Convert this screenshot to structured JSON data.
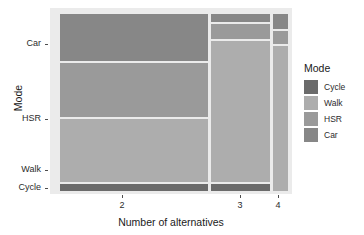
{
  "chart_data": {
    "type": "bar",
    "subtype": "mosaic",
    "title": "",
    "xlabel": "Number of alternatives",
    "ylabel": "Mode",
    "xtick_labels": [
      "2",
      "3",
      "4"
    ],
    "ytick_labels": [
      "Car",
      "HSR",
      "Walk",
      "Cycle"
    ],
    "grid": false,
    "legend": {
      "title": "Mode",
      "position": "right",
      "entries": [
        {
          "label": "Cycle",
          "color": "#6b6b6b"
        },
        {
          "label": "Walk",
          "color": "#adadad"
        },
        {
          "label": "HSR",
          "color": "#9a9a9a"
        },
        {
          "label": "Car",
          "color": "#878787"
        }
      ]
    },
    "categories": [
      "2",
      "3",
      "4"
    ],
    "column_widths": [
      0.612,
      0.244,
      0.062
    ],
    "series": [
      {
        "name": "Car",
        "color": "#878787",
        "values": [
          0.262,
          0.046,
          0.081
        ]
      },
      {
        "name": "HSR",
        "color": "#9a9a9a",
        "values": [
          0.301,
          0.081,
          0.07
        ]
      },
      {
        "name": "Walk",
        "color": "#adadad",
        "values": [
          0.339,
          0.758,
          0.849
        ]
      },
      {
        "name": "Cycle",
        "color": "#6b6b6b",
        "values": [
          0.032,
          0.032,
          0.0
        ]
      }
    ],
    "tiles": [
      {
        "col": "2",
        "mode": "Car",
        "x": 60,
        "y": 14,
        "w": 148,
        "h": 47,
        "color": "#878787"
      },
      {
        "col": "2",
        "mode": "HSR",
        "x": 60,
        "y": 63,
        "w": 148,
        "h": 54,
        "color": "#9a9a9a"
      },
      {
        "col": "2",
        "mode": "Walk",
        "x": 60,
        "y": 119,
        "w": 148,
        "h": 63,
        "color": "#adadad"
      },
      {
        "col": "2",
        "mode": "Cycle",
        "x": 60,
        "y": 184,
        "w": 148,
        "h": 7,
        "color": "#6b6b6b"
      },
      {
        "col": "3",
        "mode": "Car",
        "x": 211,
        "y": 14,
        "w": 59,
        "h": 8,
        "color": "#878787"
      },
      {
        "col": "3",
        "mode": "HSR",
        "x": 211,
        "y": 24,
        "w": 59,
        "h": 15,
        "color": "#9a9a9a"
      },
      {
        "col": "3",
        "mode": "Walk",
        "x": 211,
        "y": 41,
        "w": 59,
        "h": 141,
        "color": "#adadad"
      },
      {
        "col": "3",
        "mode": "Cycle",
        "x": 211,
        "y": 184,
        "w": 59,
        "h": 7,
        "color": "#6b6b6b"
      },
      {
        "col": "4",
        "mode": "Car",
        "x": 273,
        "y": 14,
        "w": 15,
        "h": 15,
        "color": "#878787"
      },
      {
        "col": "4",
        "mode": "HSR",
        "x": 273,
        "y": 31,
        "w": 15,
        "h": 13,
        "color": "#9a9a9a"
      },
      {
        "col": "4",
        "mode": "Walk",
        "x": 273,
        "y": 46,
        "w": 15,
        "h": 145,
        "color": "#adadad"
      }
    ],
    "ytick_positions": [
      44,
      119,
      170,
      188
    ],
    "xtick_positions": [
      122,
      240,
      278
    ],
    "panel": {
      "x": 50,
      "y": 8,
      "w": 242,
      "h": 186,
      "background": "#EBEBEB"
    },
    "plot_background": "#FFFFFF"
  }
}
